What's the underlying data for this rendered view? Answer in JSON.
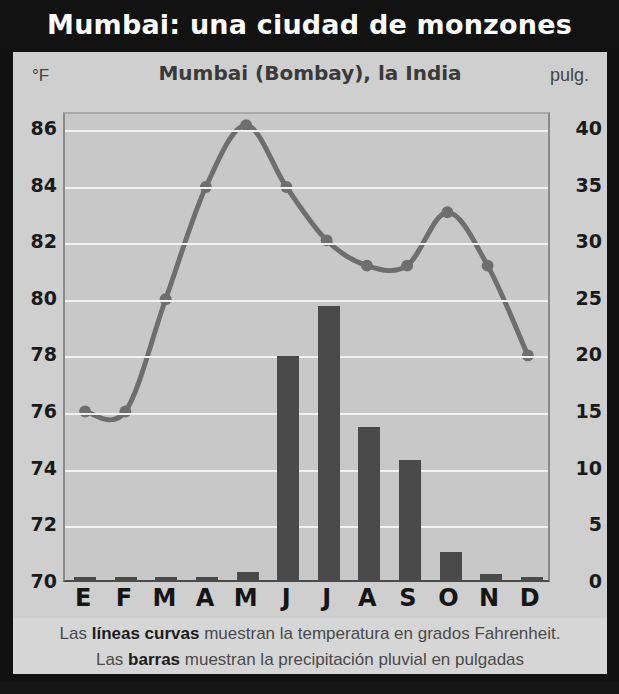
{
  "title": "Mumbai: una ciudad de monzones",
  "subtitle": "Mumbai (Bombay), la India",
  "axis_unit_left": "°F",
  "axis_unit_right": "pulg.",
  "caption": {
    "line1_pre": "Las ",
    "line1_bold": "líneas curvas",
    "line1_post": " muestran la temperatura en grados Fahrenheit.",
    "line2_pre": "Las ",
    "line2_bold": "barras",
    "line2_post": " muestran la precipitación pluvial en pulgadas"
  },
  "colors": {
    "banner_bg": "#121212",
    "panel_bg": "#cfcfcf",
    "plot_bg": "#c8c8c8",
    "bar": "#4a4a4a",
    "line": "#6e6e6e",
    "gridline": "#f2f2f2",
    "text_dark": "#1a1a1a"
  },
  "chart_data": {
    "type": "bar",
    "title": "Mumbai (Bombay), la India",
    "xlabel": "",
    "ylabel": "°F",
    "y2label": "pulg.",
    "grid": true,
    "legend_position": "none",
    "categories": [
      "E",
      "F",
      "M",
      "A",
      "M",
      "J",
      "J",
      "A",
      "S",
      "O",
      "N",
      "D"
    ],
    "category_names_full": [
      "Enero",
      "Febrero",
      "Marzo",
      "Abril",
      "Mayo",
      "Junio",
      "Julio",
      "Agosto",
      "Septiembre",
      "Octubre",
      "Noviembre",
      "Diciembre"
    ],
    "ylim": [
      70,
      86.6
    ],
    "yticks": [
      70,
      72,
      74,
      76,
      78,
      80,
      82,
      84,
      86
    ],
    "y2lim": [
      0,
      41.5
    ],
    "y2ticks": [
      0,
      5,
      10,
      15,
      20,
      25,
      30,
      35,
      40
    ],
    "series": [
      {
        "name": "Temperatura (°F)",
        "type": "line",
        "axis": "left",
        "values": [
          76.0,
          76.0,
          80.0,
          84.0,
          86.2,
          84.0,
          82.1,
          81.2,
          81.2,
          83.1,
          81.2,
          78.0
        ]
      },
      {
        "name": "Precipitación (pulg.)",
        "type": "bar",
        "axis": "right",
        "values": [
          0.1,
          0.1,
          0.1,
          0.0,
          0.7,
          19.8,
          24.2,
          13.5,
          10.6,
          2.5,
          0.5,
          0.2
        ]
      }
    ]
  }
}
